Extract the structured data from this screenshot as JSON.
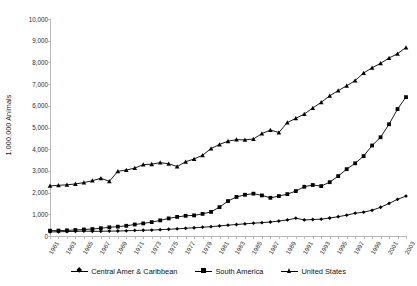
{
  "chart_data": {
    "type": "line",
    "title": "",
    "xlabel": "",
    "ylabel": "1,000,000 Animals",
    "ylim": [
      0,
      10000
    ],
    "ytick_labels": [
      "10,000",
      "9,000",
      "8,000",
      "7,000",
      "6,000",
      "5,000",
      "4,000",
      "3,000",
      "2,000",
      "1,000",
      "0"
    ],
    "ytick_values": [
      10000,
      9000,
      8000,
      7000,
      6000,
      5000,
      4000,
      3000,
      2000,
      1000,
      0
    ],
    "grid": false,
    "legend_position": "bottom",
    "x": [
      1961,
      1962,
      1963,
      1964,
      1965,
      1966,
      1967,
      1968,
      1969,
      1970,
      1971,
      1972,
      1973,
      1974,
      1975,
      1976,
      1977,
      1978,
      1979,
      1980,
      1981,
      1982,
      1983,
      1984,
      1985,
      1986,
      1987,
      1988,
      1989,
      1990,
      1991,
      1992,
      1993,
      1994,
      1995,
      1996,
      1997,
      1998,
      1999,
      2000,
      2001,
      2002,
      2003
    ],
    "xtick_labels": [
      "1961",
      "1963",
      "1965",
      "1967",
      "1969",
      "1971",
      "1973",
      "1975",
      "1977",
      "1979",
      "1981",
      "1983",
      "1985",
      "1987",
      "1989",
      "1991",
      "1993",
      "1995",
      "1997",
      "1999",
      "2001",
      "2003"
    ],
    "series": [
      {
        "name": "Central Amer & Caribbean",
        "marker": "diamond",
        "values": [
          190,
          195,
          205,
          215,
          225,
          215,
          220,
          225,
          230,
          240,
          255,
          265,
          275,
          290,
          310,
          330,
          355,
          380,
          405,
          430,
          465,
          500,
          530,
          560,
          590,
          615,
          645,
          690,
          740,
          820,
          740,
          760,
          775,
          830,
          890,
          960,
          1050,
          1100,
          1185,
          1325,
          1500,
          1690,
          1840
        ]
      },
      {
        "name": "South America",
        "marker": "square",
        "values": [
          245,
          250,
          260,
          275,
          300,
          320,
          360,
          400,
          430,
          470,
          530,
          580,
          640,
          720,
          810,
          880,
          930,
          950,
          1020,
          1110,
          1330,
          1610,
          1800,
          1900,
          1950,
          1870,
          1760,
          1840,
          1930,
          2070,
          2270,
          2350,
          2300,
          2480,
          2760,
          3080,
          3350,
          3680,
          4170,
          4550,
          5150,
          5850,
          6400
        ]
      },
      {
        "name": "United States",
        "marker": "triangle",
        "values": [
          2310,
          2335,
          2360,
          2400,
          2460,
          2550,
          2660,
          2520,
          2980,
          3040,
          3130,
          3290,
          3310,
          3380,
          3330,
          3200,
          3420,
          3550,
          3720,
          4030,
          4220,
          4370,
          4440,
          4430,
          4470,
          4720,
          4880,
          4770,
          5230,
          5420,
          5620,
          5900,
          6160,
          6460,
          6700,
          6920,
          7160,
          7510,
          7750,
          7960,
          8200,
          8400,
          8690
        ]
      }
    ]
  },
  "legend": {
    "entries": [
      {
        "label": "Central Amer & Caribbean",
        "marker": "diamond"
      },
      {
        "label": "South America",
        "marker": "square"
      },
      {
        "label": "United States",
        "marker": "triangle"
      }
    ]
  }
}
